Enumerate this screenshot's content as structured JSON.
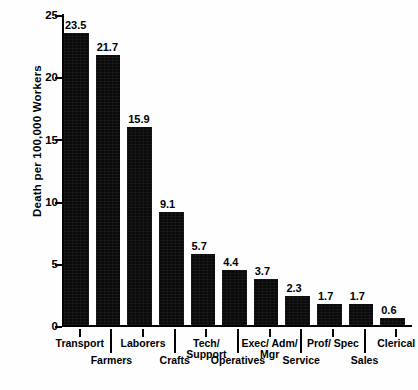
{
  "chart_data": {
    "type": "bar",
    "title": "",
    "xlabel": "",
    "ylabel": "Death per 100,000 Workers",
    "ylim": [
      0,
      25
    ],
    "yticks": [
      0,
      5,
      10,
      15,
      20,
      25
    ],
    "grid": false,
    "legend": "none",
    "orientation": "vertical",
    "bar_color": "#0a0a0a",
    "background_color": "#ffffff",
    "value_label_precision": 1,
    "label_stagger": "alternating two rows; odd-index labels on upper row, even-index labels on lower row",
    "categories": [
      "Transport",
      "Farmers",
      "Laborers",
      "Crafts",
      "Tech/ Support",
      "Operatives",
      "Exec/ Adm/ Mgr",
      "Service",
      "Prof/ Spec",
      "Sales",
      "Clerical"
    ],
    "values": [
      23.5,
      21.7,
      15.9,
      9.1,
      5.7,
      4.4,
      3.7,
      2.3,
      1.7,
      1.7,
      0.6
    ],
    "value_labels": [
      "23.5",
      "21.7",
      "15.9",
      "9.1",
      "5.7",
      "4.4",
      "3.7",
      "2.3",
      "1.7",
      "1.7",
      "0.6"
    ]
  },
  "axis": {
    "y_title": "Death per 100,000 Workers",
    "y_tick_labels": [
      "25",
      "20",
      "15",
      "10",
      "5",
      "0"
    ]
  },
  "x_label_rows": [
    {
      "text": "Transport",
      "row": "upper"
    },
    {
      "text": "Farmers",
      "row": "lower"
    },
    {
      "text": "Laborers",
      "row": "upper"
    },
    {
      "text": "Crafts",
      "row": "lower"
    },
    {
      "text": "Tech/\nSupport",
      "row": "upper",
      "line1": "Tech/",
      "line2": "Support"
    },
    {
      "text": "Operatives",
      "row": "lower"
    },
    {
      "text": "Exec/ Adm/\nMgr",
      "row": "upper",
      "line1": "Exec/ Adm/",
      "line2": "Mgr"
    },
    {
      "text": "Service",
      "row": "lower"
    },
    {
      "text": "Prof/ Spec",
      "row": "upper"
    },
    {
      "text": "Sales",
      "row": "lower"
    },
    {
      "text": "Clerical",
      "row": "upper"
    }
  ]
}
